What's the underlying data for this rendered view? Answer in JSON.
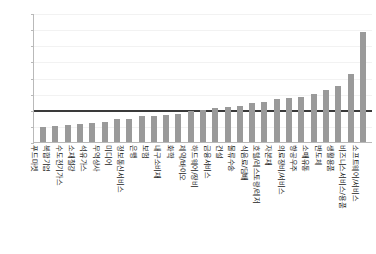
{
  "chart_data": {
    "type": "bar",
    "title": "",
    "xlabel": "",
    "ylabel": "",
    "ylim": [
      0.0,
      4.0
    ],
    "ytick_labels": [
      "4.0",
      "3.5",
      "3.0",
      "2.5",
      "2.0",
      "1.5",
      "1.0",
      "0.5",
      "0.0"
    ],
    "ytick_values": [
      4.0,
      3.5,
      3.0,
      2.5,
      2.0,
      1.5,
      1.0,
      0.5,
      0.0
    ],
    "grid": true,
    "legend": "none",
    "reference_line": 1.0,
    "bar_color": "#9a9a9a",
    "reference_line_color": "#3a3a3a",
    "axis_color": "#b9b9b9",
    "grid_color": "#f2f2f2",
    "categories": [
      "푸드마켓",
      "복합기업",
      "수도전기가스",
      "소재철강",
      "석유가스",
      "무역상사",
      "미디어",
      "정보통신서비스",
      "은행",
      "보험",
      "내구소비재",
      "화학",
      "제약/바이오",
      "하드웨어/장비",
      "금융서비스",
      "건설",
      "물류수송",
      "식음료/담배",
      "호텔/레스토랑/레저",
      "자본재",
      "의료장비/서비스",
      "항공우주",
      "소매유통",
      "반도체",
      "생활용품",
      "비즈니스서비스/용품",
      "소프트웨어/서비스"
    ],
    "values": [
      0.47,
      0.5,
      0.52,
      0.55,
      0.6,
      0.62,
      0.7,
      0.72,
      0.8,
      0.82,
      0.85,
      0.88,
      0.95,
      1.0,
      1.05,
      1.08,
      1.12,
      1.2,
      1.25,
      1.32,
      1.38,
      1.4,
      1.5,
      1.6,
      1.75,
      2.1,
      3.42
    ]
  }
}
